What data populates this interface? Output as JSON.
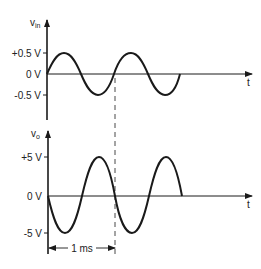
{
  "top_plot": {
    "y_label": "v",
    "y_label_sub": "in",
    "x_label": "t",
    "ticks": [
      "+0.5 V",
      "0 V",
      "-0.5 V"
    ],
    "amplitude": 0.5,
    "phase": "in-phase sine"
  },
  "bottom_plot": {
    "y_label": "v",
    "y_label_sub": "o",
    "x_label": "t",
    "ticks": [
      "+5 V",
      "0 V",
      "-5 V"
    ],
    "amplitude": 5,
    "phase": "inverted sine"
  },
  "period_annotation": {
    "label": "1 ms"
  },
  "colors": {
    "line": "#1a1a1a",
    "background": "#ffffff"
  }
}
